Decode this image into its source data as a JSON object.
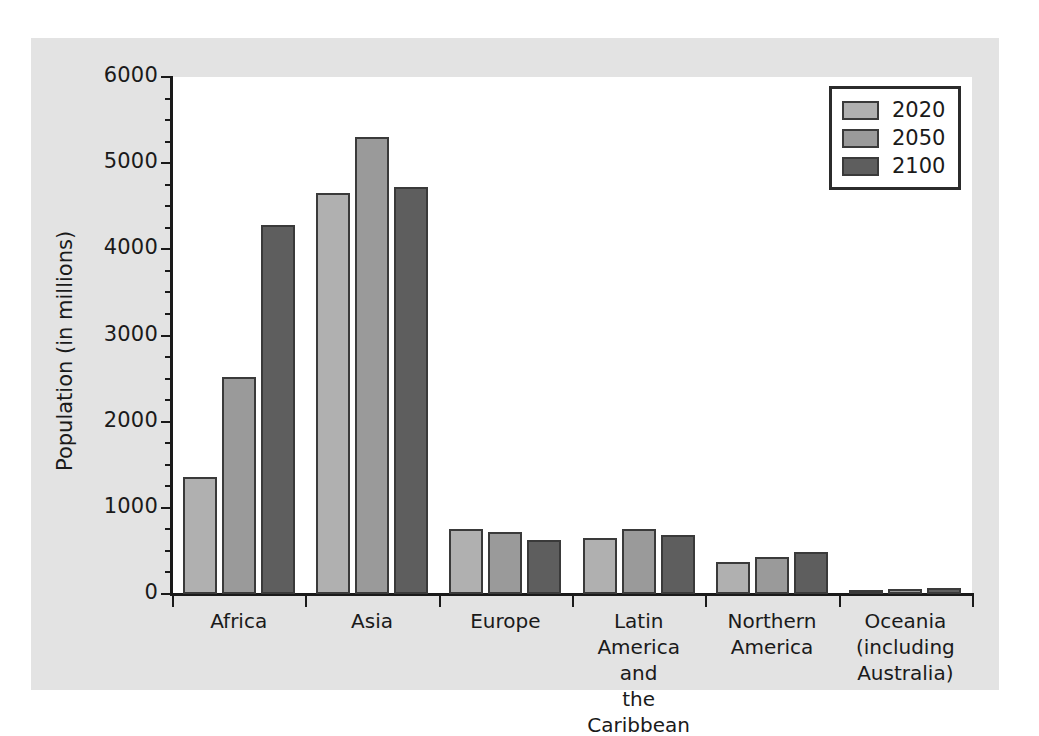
{
  "chart_data": {
    "type": "bar",
    "title": "",
    "xlabel": "",
    "ylabel": "Population (in millions)",
    "ylim": [
      0,
      6000
    ],
    "ytick_labels": [
      "0",
      "1000",
      "2000",
      "3000",
      "4000",
      "5000",
      "6000"
    ],
    "ytick_values": [
      0,
      1000,
      2000,
      3000,
      4000,
      5000,
      6000
    ],
    "minor_tick_step": 250,
    "grid": false,
    "legend_position": "top-right",
    "categories": [
      "Africa",
      "Asia",
      "Europe",
      "Latin America\nand\nthe Caribbean",
      "Northern\nAmerica",
      "Oceania\n(including\nAustralia)"
    ],
    "series": [
      {
        "name": "2020",
        "color": "#b0b0b0",
        "values": [
          1360,
          4650,
          750,
          655,
          370,
          43
        ]
      },
      {
        "name": "2050",
        "color": "#9a9a9a",
        "values": [
          2520,
          5300,
          715,
          760,
          425,
          57
        ]
      },
      {
        "name": "2100",
        "color": "#5e5e5e",
        "values": [
          4280,
          4720,
          630,
          680,
          490,
          75
        ]
      }
    ]
  },
  "legend": {
    "entries": [
      {
        "label": "2020",
        "color": "#b0b0b0"
      },
      {
        "label": "2050",
        "color": "#9a9a9a"
      },
      {
        "label": "2100",
        "color": "#5e5e5e"
      }
    ]
  },
  "colors": {
    "figure_background": "#e3e3e3",
    "plot_background": "#ffffff",
    "axis": "#1a1a1a",
    "bar_edge": "#3a3a3a",
    "series_2020": "#b0b0b0",
    "series_2050": "#9a9a9a",
    "series_2100": "#5e5e5e"
  }
}
